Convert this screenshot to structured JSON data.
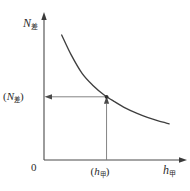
{
  "figure": {
    "background_color": "#ffffff",
    "ink_color": "#3a3a3a",
    "guide_color": "#8a8a8a",
    "axes": {
      "y_axis_label_symbol": "N",
      "y_axis_label_subscript": "差",
      "x_axis_label_symbol": "h",
      "x_axis_label_subscript": "甲",
      "origin_label": "0"
    },
    "markers": {
      "y_value_open_paren": "(",
      "y_value_symbol": "N",
      "y_value_subscript": "差",
      "y_value_close_paren": ")",
      "x_value_open_paren": "(",
      "x_value_symbol": "h",
      "x_value_subscript": "甲",
      "x_value_close_paren": ")"
    }
  },
  "chart_data": {
    "type": "line",
    "title": "",
    "xlabel": "h甲",
    "ylabel": "N差",
    "grid": false,
    "legend": null,
    "axis_arrows": [
      "up",
      "right"
    ],
    "xlim": [
      0,
      1
    ],
    "ylim": [
      0,
      1
    ],
    "curve_description": "monotonically decreasing convex hyperbolic curve",
    "x": [
      0.13,
      0.2,
      0.28,
      0.36,
      0.44,
      0.52,
      0.6,
      0.68,
      0.76,
      0.84,
      0.92
    ],
    "y": [
      0.88,
      0.74,
      0.61,
      0.525,
      0.46,
      0.41,
      0.365,
      0.33,
      0.3,
      0.275,
      0.255
    ],
    "annotations": [
      {
        "name": "operating-point",
        "x": 0.46,
        "y": 0.445,
        "guide_lines": [
          "horizontal-to-y-axis",
          "vertical-to-x-axis"
        ],
        "arrow_directions": [
          "left",
          "up"
        ]
      }
    ]
  }
}
